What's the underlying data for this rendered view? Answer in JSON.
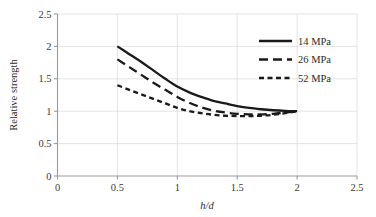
{
  "chart_data": {
    "type": "line",
    "title": "",
    "xlabel": "h/d",
    "ylabel": "Relative strength",
    "xlim": [
      0,
      2.5
    ],
    "ylim": [
      0,
      2.5
    ],
    "xticks": [
      "0",
      "0.5",
      "1",
      "1.5",
      "2",
      "2.5"
    ],
    "xtick_values": [
      0,
      0.5,
      1,
      1.5,
      2,
      2.5
    ],
    "yticks": [
      "0",
      "0.5",
      "1",
      "1.5",
      "2",
      "2.5"
    ],
    "ytick_values": [
      0,
      0.5,
      1,
      1.5,
      2,
      2.5
    ],
    "grid": true,
    "legend_position": "upper right",
    "series": [
      {
        "name": "14 MPa",
        "style": "solid",
        "color": "#1a1a1a",
        "x": [
          0.5,
          0.6,
          0.7,
          0.8,
          0.9,
          1.0,
          1.1,
          1.2,
          1.3,
          1.4,
          1.5,
          1.6,
          1.7,
          1.8,
          1.9,
          2.0
        ],
        "y": [
          2.0,
          1.88,
          1.76,
          1.63,
          1.5,
          1.38,
          1.29,
          1.22,
          1.16,
          1.12,
          1.08,
          1.05,
          1.03,
          1.015,
          1.005,
          1.0
        ]
      },
      {
        "name": "26 MPa",
        "style": "dashed-long",
        "color": "#1a1a1a",
        "x": [
          0.5,
          0.6,
          0.7,
          0.8,
          0.9,
          1.0,
          1.1,
          1.2,
          1.3,
          1.4,
          1.5,
          1.6,
          1.7,
          1.8,
          1.9,
          2.0
        ],
        "y": [
          1.8,
          1.68,
          1.56,
          1.44,
          1.33,
          1.22,
          1.13,
          1.06,
          1.01,
          0.98,
          0.96,
          0.95,
          0.95,
          0.96,
          0.98,
          1.0
        ]
      },
      {
        "name": "52 MPa",
        "style": "dashed-short",
        "color": "#1a1a1a",
        "x": [
          0.5,
          0.6,
          0.7,
          0.8,
          0.9,
          1.0,
          1.1,
          1.2,
          1.3,
          1.4,
          1.5,
          1.6,
          1.7,
          1.8,
          1.9,
          2.0
        ],
        "y": [
          1.4,
          1.33,
          1.26,
          1.19,
          1.12,
          1.05,
          1.0,
          0.97,
          0.945,
          0.93,
          0.925,
          0.925,
          0.93,
          0.945,
          0.97,
          1.0
        ]
      }
    ]
  },
  "legend": {
    "items": [
      {
        "label": "14 MPa"
      },
      {
        "label": "26 MPa"
      },
      {
        "label": "52 MPa"
      }
    ]
  }
}
